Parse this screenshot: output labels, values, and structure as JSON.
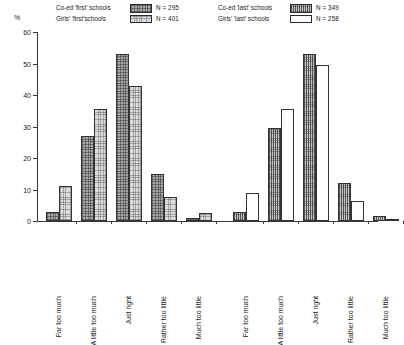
{
  "axis": {
    "y_unit": "%",
    "y_ticks": [
      "0",
      "10",
      "20",
      "30",
      "40",
      "50",
      "60"
    ]
  },
  "legends": [
    {
      "id": "legend-first",
      "entries": [
        {
          "label": "Co-ed 'first' schools",
          "swatch": "coed-first-swatch",
          "n": "N = 295"
        },
        {
          "label": "Girls' 'first'schools",
          "swatch": "girls-first-swatch",
          "n": "N = 401"
        }
      ]
    },
    {
      "id": "legend-last",
      "entries": [
        {
          "label": "Co-ed 'last' schools",
          "swatch": "coed-last-swatch",
          "n": "N = 349"
        },
        {
          "label": "Girls' 'last' schools",
          "swatch": "girls-last-swatch",
          "n": "N = 258"
        }
      ]
    }
  ],
  "chart_data": {
    "type": "bar",
    "title": "",
    "xlabel": "",
    "ylabel": "%",
    "ylim": [
      0,
      60
    ],
    "ytick_step": 10,
    "grid": false,
    "legend_position": "top",
    "panels": [
      {
        "name": "first-schools-panel",
        "categories": [
          "Far too much",
          "A little too much",
          "Just right",
          "Rather too little",
          "Much too little"
        ],
        "series": [
          {
            "name": "Co-ed 'first' schools",
            "n": 295,
            "values": [
              3,
              27,
              53,
              15,
              1
            ]
          },
          {
            "name": "Girls' 'first'schools",
            "n": 401,
            "values": [
              11,
              35.5,
              43,
              7.5,
              2.5
            ]
          }
        ]
      },
      {
        "name": "last-schools-panel",
        "categories": [
          "Far too much",
          "A little too much",
          "Just right",
          "Rather too little",
          "Much too little"
        ],
        "series": [
          {
            "name": "Co-ed 'last' schools",
            "n": 349,
            "values": [
              3,
              29.5,
              53,
              12,
              1.5
            ]
          },
          {
            "name": "Girls' 'last' schools",
            "n": 258,
            "values": [
              9,
              35.5,
              49.5,
              6.5,
              0.5
            ]
          }
        ]
      }
    ]
  }
}
